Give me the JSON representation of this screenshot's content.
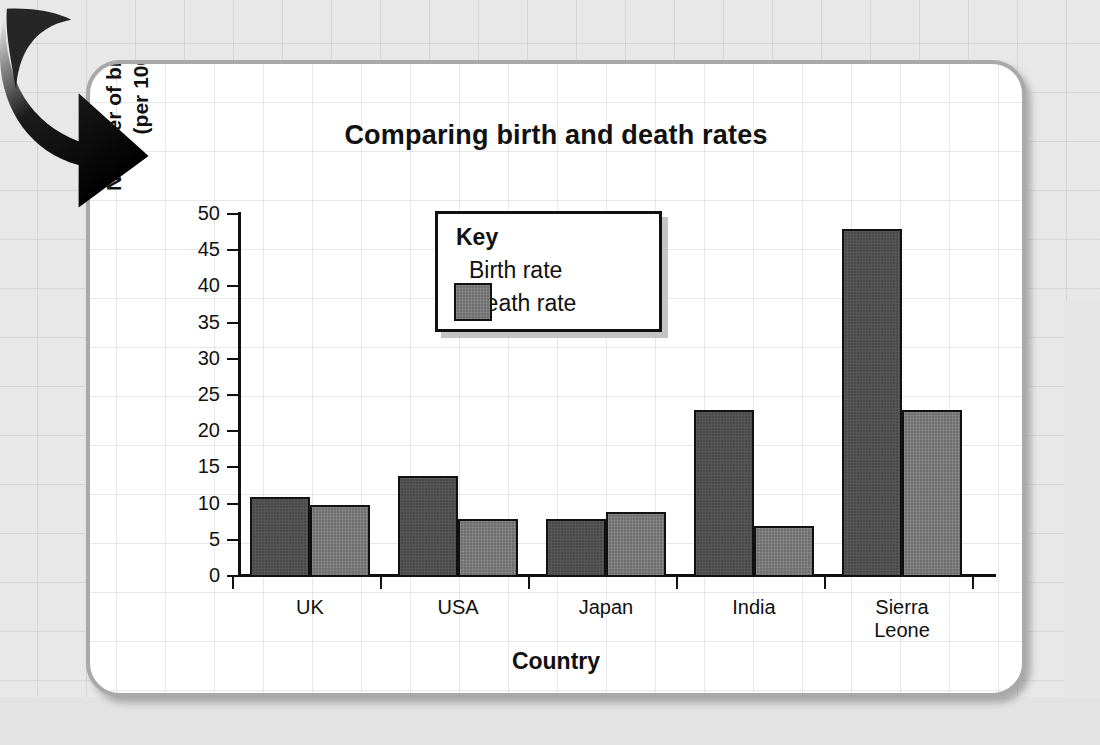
{
  "chart_data": {
    "type": "bar",
    "title": "Comparing birth and death rates",
    "xlabel": "Country",
    "ylabel_line1": "Number of births and deaths",
    "ylabel_line2": "(per 1000 people)",
    "categories": [
      "UK",
      "USA",
      "Japan",
      "India",
      "Sierra\nLeone"
    ],
    "category_labels": [
      {
        "line1": "UK",
        "line2": ""
      },
      {
        "line1": "USA",
        "line2": ""
      },
      {
        "line1": "Japan",
        "line2": ""
      },
      {
        "line1": "India",
        "line2": ""
      },
      {
        "line1": "Sierra",
        "line2": "Leone"
      }
    ],
    "series": [
      {
        "name": "Birth rate",
        "color": "#4a4a4a",
        "values": [
          11,
          14,
          8,
          23,
          48
        ]
      },
      {
        "name": "Death rate",
        "color": "#6f6f6f",
        "values": [
          10,
          8,
          9,
          7,
          23
        ]
      }
    ],
    "ylim": [
      0,
      50
    ],
    "ytick_values": [
      0,
      5,
      10,
      15,
      20,
      25,
      30,
      35,
      40,
      45,
      50
    ],
    "ytick_labels": [
      "0",
      "5",
      "10",
      "15",
      "20",
      "25",
      "30",
      "35",
      "40",
      "45",
      "50"
    ],
    "grid": true,
    "legend_position": "inside-top-center"
  },
  "legend": {
    "title": "Key",
    "entries": [
      {
        "label": "Birth rate",
        "swatch": "birth-rate-swatch"
      },
      {
        "label": "Death rate",
        "swatch": "death-rate-swatch"
      }
    ]
  },
  "decoration": {
    "arrow": "curved-down-arrow"
  }
}
